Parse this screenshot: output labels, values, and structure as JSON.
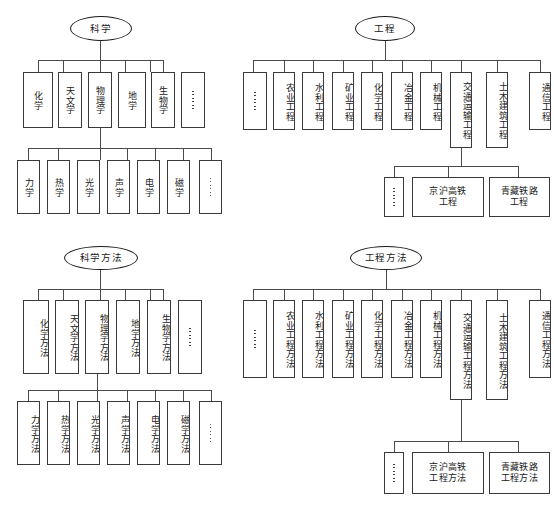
{
  "diagram": {
    "type": "hierarchy-tree",
    "orientation": "top-down",
    "node_shapes": {
      "root": "ellipse",
      "leaf": "rectangle"
    },
    "line_color": "#4a4a4a",
    "box_border_color": "#3a3a3a",
    "background": "#ffffff"
  },
  "quadrants": {
    "top_left": {
      "root": "科学",
      "level1": [
        {
          "label": "化学"
        },
        {
          "label": "天文学"
        },
        {
          "label": "物理学"
        },
        {
          "label": "地学"
        },
        {
          "label": "生物学"
        },
        {
          "label": "⋯⋯",
          "ellipsis": true
        }
      ],
      "level2_parent": "物理学",
      "level2": [
        {
          "label": "力学"
        },
        {
          "label": "热学"
        },
        {
          "label": "光学"
        },
        {
          "label": "声学"
        },
        {
          "label": "电学"
        },
        {
          "label": "磁学"
        },
        {
          "label": "⋯⋯",
          "ellipsis": true
        }
      ]
    },
    "top_right": {
      "root": "工程",
      "level1": [
        {
          "label": "⋯⋯",
          "ellipsis": true
        },
        {
          "label": "农业工程"
        },
        {
          "label": "水利工程"
        },
        {
          "label": "矿业工程"
        },
        {
          "label": "化学工程"
        },
        {
          "label": "冶金工程"
        },
        {
          "label": "机械工程"
        },
        {
          "label": "交通运输工程"
        },
        {
          "label": "土木建筑工程"
        },
        {
          "label": "通信工程"
        }
      ],
      "level2_parent": "交通运输工程",
      "level2": [
        {
          "label": "⋯⋯",
          "ellipsis": true
        },
        {
          "line1": "京沪高铁",
          "line2": "工程"
        },
        {
          "line1": "青藏铁路",
          "line2": "工程"
        }
      ]
    },
    "bottom_left": {
      "root": "科学方法",
      "level1": [
        {
          "label": "化学方法"
        },
        {
          "label": "天文学方法"
        },
        {
          "label": "物理学方法"
        },
        {
          "label": "地学方法"
        },
        {
          "label": "生物学方法"
        },
        {
          "label": "⋯⋯",
          "ellipsis": true
        }
      ],
      "level2_parent": "物理学方法",
      "level2": [
        {
          "label": "力学方法"
        },
        {
          "label": "热学方法"
        },
        {
          "label": "光学方法"
        },
        {
          "label": "声学方法"
        },
        {
          "label": "电学方法"
        },
        {
          "label": "磁学方法"
        },
        {
          "label": "⋯⋯",
          "ellipsis": true
        }
      ]
    },
    "bottom_right": {
      "root": "工程方法",
      "level1": [
        {
          "label": "⋯⋯",
          "ellipsis": true
        },
        {
          "label": "农业工程方法"
        },
        {
          "label": "水利工程方法"
        },
        {
          "label": "矿业工程方法"
        },
        {
          "label": "化学工程方法"
        },
        {
          "label": "冶金工程方法"
        },
        {
          "label": "机械工程方法"
        },
        {
          "label": "交通运输工程方法"
        },
        {
          "label": "土木建筑工程方法"
        },
        {
          "label": "通信工程方法"
        }
      ],
      "level2_parent": "交通运输工程方法",
      "level2": [
        {
          "label": "⋯⋯",
          "ellipsis": true
        },
        {
          "line1": "京沪高铁",
          "line2": "工程方法"
        },
        {
          "line1": "青藏铁路",
          "line2": "工程方法"
        }
      ]
    }
  }
}
